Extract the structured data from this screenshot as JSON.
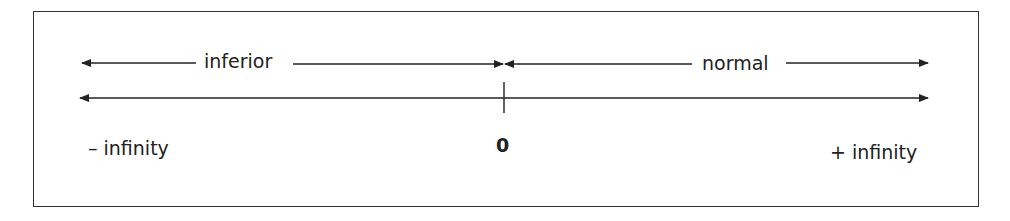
{
  "diagram": {
    "type": "number-line",
    "ranges": [
      {
        "label": "inferior",
        "from": "- infinity",
        "to": "0"
      },
      {
        "label": "normal",
        "from": "0",
        "to": "+ infinity"
      }
    ],
    "axis": {
      "left_label": "– infinity",
      "center_label": "0",
      "right_label": "+ infinity"
    },
    "colors": {
      "line": "#222222",
      "background": "#ffffff"
    }
  }
}
